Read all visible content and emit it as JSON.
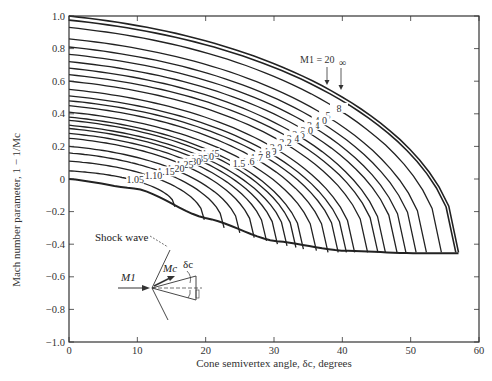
{
  "chart_data": {
    "type": "line",
    "title": "",
    "xlabel": "Cone semivertex angle, δc, degrees",
    "ylabel": "Mach number parameter, 1 − 1/Mc",
    "xlim": [
      0,
      60
    ],
    "ylim": [
      -1.0,
      1.0
    ],
    "x_ticks": [
      0,
      10,
      20,
      30,
      40,
      50,
      60
    ],
    "y_ticks": [
      1.0,
      0.8,
      0.6,
      0.4,
      0.2,
      0,
      -0.2,
      -0.4,
      -0.6,
      -0.8,
      -1.0
    ],
    "y_tick_labels": [
      "1.0",
      "0.8",
      "0.6",
      "0.4",
      "0.2",
      "0",
      "−0.2",
      "−0.4",
      "−0.6",
      "−0.8",
      "−1.0"
    ],
    "grid": false,
    "legend": "inline curve labels",
    "series": [
      {
        "name": "∞",
        "start": 1.0,
        "end_x": 57.0,
        "end_y": -0.45
      },
      {
        "name": "20",
        "start": 0.975,
        "end_x": 56.6,
        "end_y": -0.45
      },
      {
        "name": "8",
        "start": 0.93,
        "end_x": 54.5,
        "end_y": -0.45
      },
      {
        "name": "5",
        "start": 0.86,
        "end_x": 52.3,
        "end_y": -0.45
      },
      {
        "name": "4.0",
        "start": 0.81,
        "end_x": 50.8,
        "end_y": -0.45
      },
      {
        "name": "3.4",
        "start": 0.765,
        "end_x": 49.3,
        "end_y": -0.45
      },
      {
        "name": "3.0",
        "start": 0.72,
        "end_x": 48.0,
        "end_y": -0.45
      },
      {
        "name": "2.6",
        "start": 0.68,
        "end_x": 46.3,
        "end_y": -0.45
      },
      {
        "name": "2.4",
        "start": 0.64,
        "end_x": 45.2,
        "end_y": -0.45
      },
      {
        "name": "2.2",
        "start": 0.6,
        "end_x": 43.7,
        "end_y": -0.45
      },
      {
        "name": "2.0",
        "start": 0.55,
        "end_x": 41.8,
        "end_y": -0.45
      },
      {
        "name": "1.9",
        "start": 0.51,
        "end_x": 40.6,
        "end_y": -0.45
      },
      {
        "name": "1.8",
        "start": 0.48,
        "end_x": 39.4,
        "end_y": -0.45
      },
      {
        "name": "1.7",
        "start": 0.45,
        "end_x": 37.9,
        "end_y": -0.45
      },
      {
        "name": "1.6",
        "start": 0.41,
        "end_x": 36.2,
        "end_y": -0.44
      },
      {
        "name": "1.5",
        "start": 0.38,
        "end_x": 34.3,
        "end_y": -0.43
      },
      {
        "name": "1.45",
        "start": 0.36,
        "end_x": 33.2,
        "end_y": -0.42
      },
      {
        "name": "1.40",
        "start": 0.33,
        "end_x": 31.9,
        "end_y": -0.41
      },
      {
        "name": "1.35",
        "start": 0.31,
        "end_x": 30.5,
        "end_y": -0.4
      },
      {
        "name": "1.30",
        "start": 0.28,
        "end_x": 28.9,
        "end_y": -0.38
      },
      {
        "name": "1.25",
        "start": 0.25,
        "end_x": 27.1,
        "end_y": -0.36
      },
      {
        "name": "1.20",
        "start": 0.2,
        "end_x": 25.0,
        "end_y": -0.33
      },
      {
        "name": "1.15",
        "start": 0.16,
        "end_x": 22.7,
        "end_y": -0.3
      },
      {
        "name": "1.10",
        "start": 0.11,
        "end_x": 19.8,
        "end_y": -0.25
      },
      {
        "name": "1.05",
        "start": 0.05,
        "end_x": 15.5,
        "end_y": -0.17
      }
    ],
    "envelope": {
      "name": "envelope (detachment)",
      "points": [
        [
          0,
          0
        ],
        [
          10,
          -0.06
        ],
        [
          20,
          -0.24
        ],
        [
          30,
          -0.38
        ],
        [
          40,
          -0.44
        ],
        [
          50,
          -0.455
        ],
        [
          57.0,
          -0.455
        ]
      ]
    },
    "annotations": {
      "m1_label": "M1 = 20",
      "inf_label": "∞",
      "inset": {
        "shock_wave": "Shock wave",
        "m1": "M1",
        "mc": "Mc",
        "delta_c": "δc"
      }
    }
  }
}
